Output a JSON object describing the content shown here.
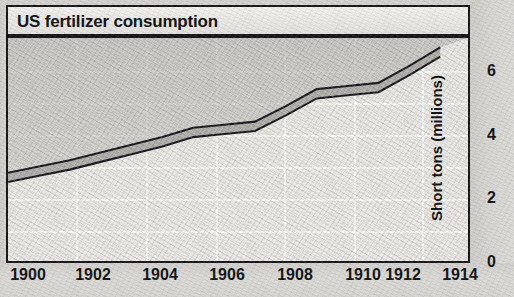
{
  "title": "US fertilizer consumption",
  "axes": {
    "y_label": "Short tons (millions)",
    "x_ticks": [
      "1900",
      "1902",
      "1904",
      "1906",
      "1908",
      "1910",
      "1912",
      "1914"
    ],
    "y_ticks": [
      "0",
      "2",
      "4",
      "6"
    ]
  },
  "colors": {
    "ink": "#16161a",
    "plot_background": "#eceae6",
    "grid": "#fbfbf9",
    "band_fill": "#b9b8b4",
    "page": "#d9d9d6"
  },
  "chart_data": {
    "type": "line",
    "title": "US fertilizer consumption",
    "xlabel": "",
    "ylabel": "Short tons (millions)",
    "xlim": [
      1900,
      1914.9
    ],
    "ylim": [
      0,
      7.2
    ],
    "grid": true,
    "legend": null,
    "x_tick_labels": [
      "1900",
      "1902",
      "1904",
      "1906",
      "1908",
      "1910",
      "1912",
      "1914"
    ],
    "y_tick_labels": [
      "0",
      "2",
      "4",
      "6"
    ],
    "y_tick_values": [
      0,
      2,
      4,
      6
    ],
    "minor_gridline_values": [
      1,
      2,
      3,
      4,
      5,
      6
    ],
    "series": [
      {
        "name": "Upper bound",
        "x": [
          1900.0,
          1901.0,
          1902.0,
          1903.0,
          1904.0,
          1905.0,
          1906.0,
          1907.0,
          1908.0,
          1909.0,
          1910.0,
          1911.0,
          1912.0,
          1913.0,
          1914.0
        ],
        "values": [
          2.85,
          3.05,
          3.25,
          3.5,
          3.75,
          4.0,
          4.3,
          4.4,
          4.5,
          5.0,
          5.55,
          5.65,
          5.75,
          6.3,
          6.9
        ]
      },
      {
        "name": "Lower bound",
        "x": [
          1900.0,
          1901.0,
          1902.0,
          1903.0,
          1904.0,
          1905.0,
          1906.0,
          1907.0,
          1908.0,
          1909.0,
          1910.0,
          1911.0,
          1912.0,
          1913.0,
          1914.0
        ],
        "values": [
          2.55,
          2.75,
          2.95,
          3.2,
          3.45,
          3.7,
          4.0,
          4.1,
          4.2,
          4.7,
          5.25,
          5.35,
          5.45,
          6.0,
          6.6
        ]
      }
    ]
  }
}
